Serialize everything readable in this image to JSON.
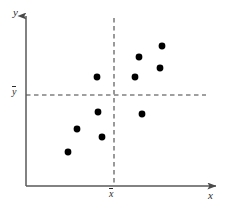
{
  "figure": {
    "type": "scatter-plot-quadrant-diagram",
    "background_color": "#ffffff",
    "axis_color": "#595959",
    "point_color": "#000000",
    "dash_color": "#7a7a7a"
  },
  "labels": {
    "y_axis": "y",
    "x_axis": "x",
    "y_mean": "y",
    "x_mean": "x",
    "y_mean_full": "ȳ",
    "x_mean_full": "x̄"
  },
  "chart_data": {
    "type": "scatter",
    "title": "",
    "xlabel": "x",
    "ylabel": "y",
    "grid": false,
    "legend": null,
    "xlim": [
      0,
      100
    ],
    "ylim": [
      0,
      100
    ],
    "mean_lines": {
      "x_mean": 51,
      "y_mean": 53,
      "x_mean_label": "x̄",
      "y_mean_label": "ȳ",
      "style": "dashed"
    },
    "points": [
      {
        "x": 76,
        "y": 81,
        "px": 162,
        "py": 46,
        "quadrant": "upper-right"
      },
      {
        "x": 64,
        "y": 75,
        "px": 139,
        "py": 57,
        "quadrant": "upper-right"
      },
      {
        "x": 75,
        "y": 69,
        "px": 160,
        "py": 68,
        "quadrant": "upper-right"
      },
      {
        "x": 62,
        "y": 63,
        "px": 135,
        "py": 77,
        "quadrant": "upper-right"
      },
      {
        "x": 42,
        "y": 63,
        "px": 97,
        "py": 77,
        "quadrant": "upper-left"
      },
      {
        "x": 65,
        "y": 42,
        "px": 142,
        "py": 114,
        "quadrant": "lower-right"
      },
      {
        "x": 43,
        "y": 43,
        "px": 98,
        "py": 112,
        "quadrant": "lower-left"
      },
      {
        "x": 31,
        "y": 33,
        "px": 77,
        "py": 129,
        "quadrant": "lower-left"
      },
      {
        "x": 45,
        "y": 29,
        "px": 102,
        "py": 137,
        "quadrant": "lower-left"
      },
      {
        "x": 26,
        "y": 20,
        "px": 68,
        "py": 152,
        "quadrant": "lower-left"
      }
    ],
    "point_count": 10,
    "point_radius_px": 3.4
  },
  "geometry": {
    "y_axis_x": 26,
    "x_axis_y": 186,
    "y_axis_top": 14,
    "x_axis_right": 218,
    "vline_x": 114,
    "vline_top": 18,
    "hline_y": 95,
    "hline_right": 206
  }
}
